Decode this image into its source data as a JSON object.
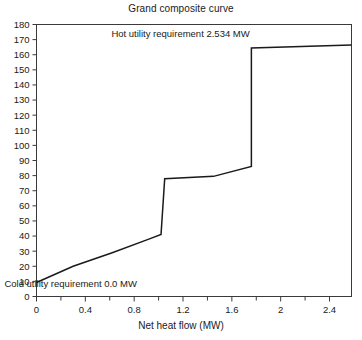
{
  "chart_data": {
    "type": "line",
    "title": "Grand composite curve",
    "xlabel": "Net heat flow (MW)",
    "ylabel": "",
    "xlim": [
      0,
      2.58
    ],
    "ylim": [
      0,
      180
    ],
    "grid": false,
    "legend": "none",
    "xticks": [
      0,
      0.4,
      0.8,
      1.2,
      1.6,
      2,
      2.4
    ],
    "xtick_labels": [
      "0",
      "0.4",
      "0.8",
      "1.2",
      "1.6",
      "2",
      "2.4"
    ],
    "xminor_ticks": [
      0.2,
      0.6,
      1.0,
      1.4,
      1.8,
      2.2
    ],
    "yticks": [
      0,
      10,
      20,
      30,
      40,
      50,
      60,
      70,
      80,
      90,
      100,
      110,
      120,
      130,
      140,
      150,
      160,
      170,
      180
    ],
    "ytick_labels": [
      "0",
      "10",
      "20",
      "30",
      "40",
      "50",
      "60",
      "70",
      "80",
      "90",
      "100",
      "110",
      "120",
      "130",
      "140",
      "150",
      "160",
      "170",
      "180"
    ],
    "series": [
      {
        "name": "Grand composite curve",
        "color": "#1a1a1a",
        "x": [
          0.0,
          0.3,
          0.62,
          0.92,
          1.02,
          1.05,
          1.45,
          1.76,
          1.76,
          2.58
        ],
        "y": [
          9.3,
          20.0,
          29.0,
          38.0,
          41.0,
          78.0,
          79.5,
          86.0,
          164.5,
          166.5
        ]
      }
    ],
    "annotations": [
      {
        "name": "hot-utility-annotation",
        "text": "Hot utility requirement 2.534 MW",
        "x": 1.18,
        "y": 172
      },
      {
        "name": "cold-utility-annotation",
        "text": "Cold utility requirement 0.0 MW",
        "x": 0.28,
        "y": 6
      }
    ]
  }
}
